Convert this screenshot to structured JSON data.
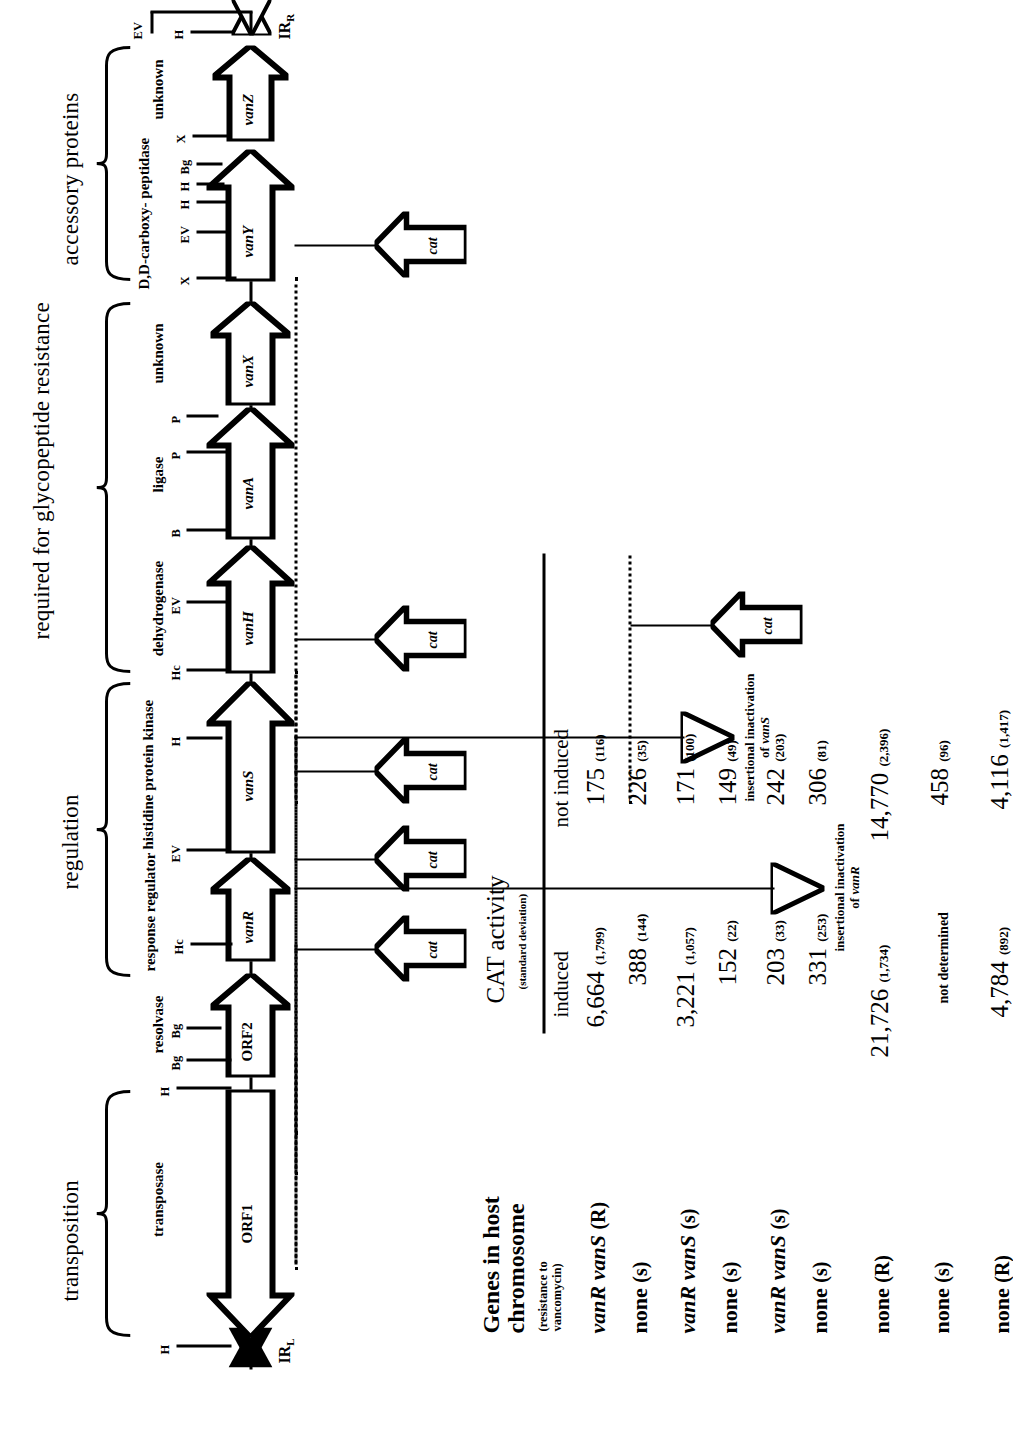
{
  "figure": {
    "function_brackets": [
      {
        "name": "transposition",
        "label": "transposition"
      },
      {
        "name": "regulation",
        "label": "regulation"
      },
      {
        "name": "resistance",
        "label": "required for glycopeptide resistance"
      },
      {
        "name": "accessory",
        "label": "accessory proteins"
      }
    ],
    "gene_functions": [
      {
        "gene": "ORF1",
        "label": "transposase"
      },
      {
        "gene": "ORF2",
        "label": "resolvase"
      },
      {
        "gene": "vanR",
        "label": "response regulator"
      },
      {
        "gene": "vanS",
        "label": "histidine protein kinase"
      },
      {
        "gene": "vanH",
        "label": "dehydrogenase"
      },
      {
        "gene": "vanA",
        "label": "ligase"
      },
      {
        "gene": "vanX",
        "label": "unknown"
      },
      {
        "gene": "vanY",
        "label": "D,D-carboxy- peptidase"
      },
      {
        "gene": "vanZ",
        "label": "unknown"
      }
    ],
    "genes": [
      "ORF1",
      "ORF2",
      "vanR",
      "vanS",
      "vanH",
      "vanA",
      "vanX",
      "vanY",
      "vanZ"
    ],
    "inverted_repeats": [
      {
        "name": "IR-left",
        "label": "IR",
        "sub": "L"
      },
      {
        "name": "IR-right",
        "label": "IR",
        "sub": "R"
      }
    ],
    "restriction_sites": [
      {
        "label": "H",
        "near": "IR-left-outer"
      },
      {
        "label": "H",
        "near": "ORF1-end"
      },
      {
        "label": "Bg",
        "near": "ORF2-a"
      },
      {
        "label": "Bg",
        "near": "ORF2-b"
      },
      {
        "label": "Hc",
        "near": "vanR"
      },
      {
        "label": "EV",
        "near": "vanR-vanS"
      },
      {
        "label": "H",
        "near": "vanS-end"
      },
      {
        "label": "Hc",
        "near": "vanH-start"
      },
      {
        "label": "EV",
        "near": "vanH"
      },
      {
        "label": "B",
        "near": "vanA"
      },
      {
        "label": "P",
        "near": "vanA-b"
      },
      {
        "label": "P",
        "near": "vanA-vanX"
      },
      {
        "label": "X",
        "near": "vanY-start"
      },
      {
        "label": "EV",
        "near": "vanY-a"
      },
      {
        "label": "H",
        "near": "vanY-b"
      },
      {
        "label": "H",
        "near": "vanY-c"
      },
      {
        "label": "Bg",
        "near": "vanY-d"
      },
      {
        "label": "X",
        "near": "vanZ-start"
      },
      {
        "label": "H",
        "near": "IR-right-inner"
      },
      {
        "label": "EV",
        "near": "IR-right-outer"
      }
    ],
    "cat_label": "cat",
    "cat_constructs": [
      {
        "id": "cat-1",
        "row": 1
      },
      {
        "id": "cat-2",
        "row": 2
      },
      {
        "id": "cat-3",
        "row": 3
      },
      {
        "id": "cat-4",
        "row": 4
      },
      {
        "id": "cat-5",
        "row": 5
      },
      {
        "id": "cat-6",
        "row": 6
      }
    ],
    "annotations": [
      {
        "id": "ins-vanR",
        "line1": "insertional inactivation",
        "line2": "of vanR",
        "italic": "vanR"
      },
      {
        "id": "ins-vanS",
        "line1": "insertional inactivation",
        "line2": "of vanS",
        "italic": "vanS"
      }
    ]
  },
  "table": {
    "genes_header_line1": "Genes in host",
    "genes_header_line2": "chromosome",
    "genes_header_sub1": "(resistance to",
    "genes_header_sub2": "vancomycin)",
    "cat_header": "CAT activity",
    "cat_header_sub": "(standard deviation)",
    "columns": [
      "induced",
      "not induced"
    ],
    "rows": [
      {
        "host_genes": "vanR vanS",
        "phenotype": "(R)",
        "induced": "6,664",
        "induced_sd": "(1,799)",
        "not_induced": "175",
        "not_induced_sd": "(116)"
      },
      {
        "host_genes": "none",
        "phenotype": "(s)",
        "induced": "388",
        "induced_sd": "(144)",
        "not_induced": "226",
        "not_induced_sd": "(35)"
      },
      {
        "host_genes": "vanR vanS",
        "phenotype": "(s)",
        "induced": "3,221",
        "induced_sd": "(1,057)",
        "not_induced": "171",
        "not_induced_sd": "(100)"
      },
      {
        "host_genes": "none",
        "phenotype": "(s)",
        "induced": "152",
        "induced_sd": "(22)",
        "not_induced": "149",
        "not_induced_sd": "(49)"
      },
      {
        "host_genes": "vanR vanS",
        "phenotype": "(s)",
        "induced": "203",
        "induced_sd": "(33)",
        "not_induced": "242",
        "not_induced_sd": "(203)"
      },
      {
        "host_genes": "none",
        "phenotype": "(s)",
        "induced": "331",
        "induced_sd": "(253)",
        "not_induced": "306",
        "not_induced_sd": "(81)"
      },
      {
        "host_genes": "none",
        "phenotype": "(R)",
        "induced": "21,726",
        "induced_sd": "(1,734)",
        "not_induced": "14,770",
        "not_induced_sd": "(2,396)"
      },
      {
        "host_genes": "none",
        "phenotype": "(s)",
        "induced": "not determined",
        "induced_sd": "",
        "not_induced": "458",
        "not_induced_sd": "(96)"
      },
      {
        "host_genes": "none",
        "phenotype": "(R)",
        "induced": "4,784",
        "induced_sd": "(892)",
        "not_induced": "4,116",
        "not_induced_sd": "(1,417)"
      }
    ]
  },
  "colors": {
    "ink": "#000000",
    "paper": "#ffffff"
  }
}
